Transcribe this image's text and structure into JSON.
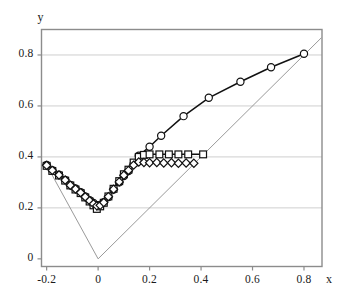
{
  "chart_data": {
    "type": "line",
    "title": "",
    "subtitle": "",
    "xlabel": "x",
    "ylabel": "y",
    "xlim": [
      -0.22,
      0.87
    ],
    "ylim": [
      -0.03,
      0.9
    ],
    "xticks": [
      -0.2,
      0,
      0.2,
      0.4,
      0.6,
      0.8
    ],
    "xtick_labels": [
      "-0.2",
      "0",
      "0.2",
      "0.4",
      "0.6",
      "0.8"
    ],
    "yticks": [
      0,
      0.2,
      0.4,
      0.6,
      0.8
    ],
    "ytick_labels": [
      "0",
      "0.2",
      "0.4",
      "0.6",
      "0.8"
    ],
    "grid": true,
    "grid_axis": "y",
    "legend": "none",
    "marker_face_color": "#ffffff",
    "line_color": "#111111",
    "reference_line_color": "#9a9a9a",
    "grid_color": "#cfcfcf",
    "axis_color": "#8c8c8c",
    "series": [
      {
        "name": "circles",
        "marker": "circle",
        "points": [
          [
            -0.2,
            0.368
          ],
          [
            -0.178,
            0.348
          ],
          [
            -0.152,
            0.33
          ],
          [
            -0.128,
            0.31
          ],
          [
            -0.108,
            0.29
          ],
          [
            -0.088,
            0.276
          ],
          [
            -0.068,
            0.262
          ],
          [
            -0.05,
            0.245
          ],
          [
            -0.033,
            0.23
          ],
          [
            -0.018,
            0.219
          ],
          [
            -0.005,
            0.211
          ],
          [
            0.008,
            0.212
          ],
          [
            0.022,
            0.222
          ],
          [
            0.04,
            0.243
          ],
          [
            0.06,
            0.272
          ],
          [
            0.082,
            0.3
          ],
          [
            0.1,
            0.325
          ],
          [
            0.118,
            0.345
          ],
          [
            0.138,
            0.372
          ],
          [
            0.158,
            0.405
          ],
          [
            0.2,
            0.44
          ],
          [
            0.245,
            0.483
          ],
          [
            0.332,
            0.56
          ],
          [
            0.43,
            0.632
          ],
          [
            0.553,
            0.695
          ],
          [
            0.672,
            0.752
          ],
          [
            0.8,
            0.805
          ]
        ]
      },
      {
        "name": "squares",
        "marker": "square",
        "points": [
          [
            -0.2,
            0.365
          ],
          [
            -0.178,
            0.345
          ],
          [
            -0.152,
            0.327
          ],
          [
            -0.128,
            0.307
          ],
          [
            -0.108,
            0.288
          ],
          [
            -0.088,
            0.272
          ],
          [
            -0.068,
            0.258
          ],
          [
            -0.05,
            0.241
          ],
          [
            -0.033,
            0.225
          ],
          [
            -0.018,
            0.21
          ],
          [
            -0.005,
            0.196
          ],
          [
            0.008,
            0.206
          ],
          [
            0.022,
            0.22
          ],
          [
            0.04,
            0.245
          ],
          [
            0.06,
            0.275
          ],
          [
            0.082,
            0.305
          ],
          [
            0.1,
            0.332
          ],
          [
            0.118,
            0.35
          ],
          [
            0.138,
            0.378
          ],
          [
            0.158,
            0.4
          ],
          [
            0.178,
            0.408
          ],
          [
            0.2,
            0.41
          ],
          [
            0.238,
            0.41
          ],
          [
            0.275,
            0.41
          ],
          [
            0.312,
            0.41
          ],
          [
            0.35,
            0.41
          ],
          [
            0.408,
            0.41
          ]
        ]
      },
      {
        "name": "diamonds",
        "marker": "diamond",
        "points": [
          [
            -0.2,
            0.367
          ],
          [
            -0.178,
            0.347
          ],
          [
            -0.152,
            0.329
          ],
          [
            -0.128,
            0.309
          ],
          [
            -0.108,
            0.289
          ],
          [
            -0.088,
            0.274
          ],
          [
            -0.068,
            0.26
          ],
          [
            -0.05,
            0.243
          ],
          [
            -0.033,
            0.228
          ],
          [
            -0.018,
            0.216
          ],
          [
            -0.005,
            0.208
          ],
          [
            0.008,
            0.21
          ],
          [
            0.022,
            0.221
          ],
          [
            0.04,
            0.244
          ],
          [
            0.06,
            0.273
          ],
          [
            0.082,
            0.302
          ],
          [
            0.1,
            0.328
          ],
          [
            0.118,
            0.347
          ],
          [
            0.138,
            0.368
          ],
          [
            0.158,
            0.38
          ],
          [
            0.178,
            0.378
          ],
          [
            0.2,
            0.377
          ],
          [
            0.228,
            0.378
          ],
          [
            0.255,
            0.376
          ],
          [
            0.285,
            0.377
          ],
          [
            0.312,
            0.375
          ],
          [
            0.342,
            0.376
          ],
          [
            0.372,
            0.375
          ]
        ]
      }
    ],
    "reference_lines": [
      {
        "name": "left-diagonal",
        "from": [
          -0.2,
          0.368
        ],
        "to": [
          0.0,
          0.0
        ]
      },
      {
        "name": "identity-diagonal",
        "from": [
          0.0,
          0.0
        ],
        "to": [
          0.868,
          0.868
        ]
      }
    ]
  }
}
